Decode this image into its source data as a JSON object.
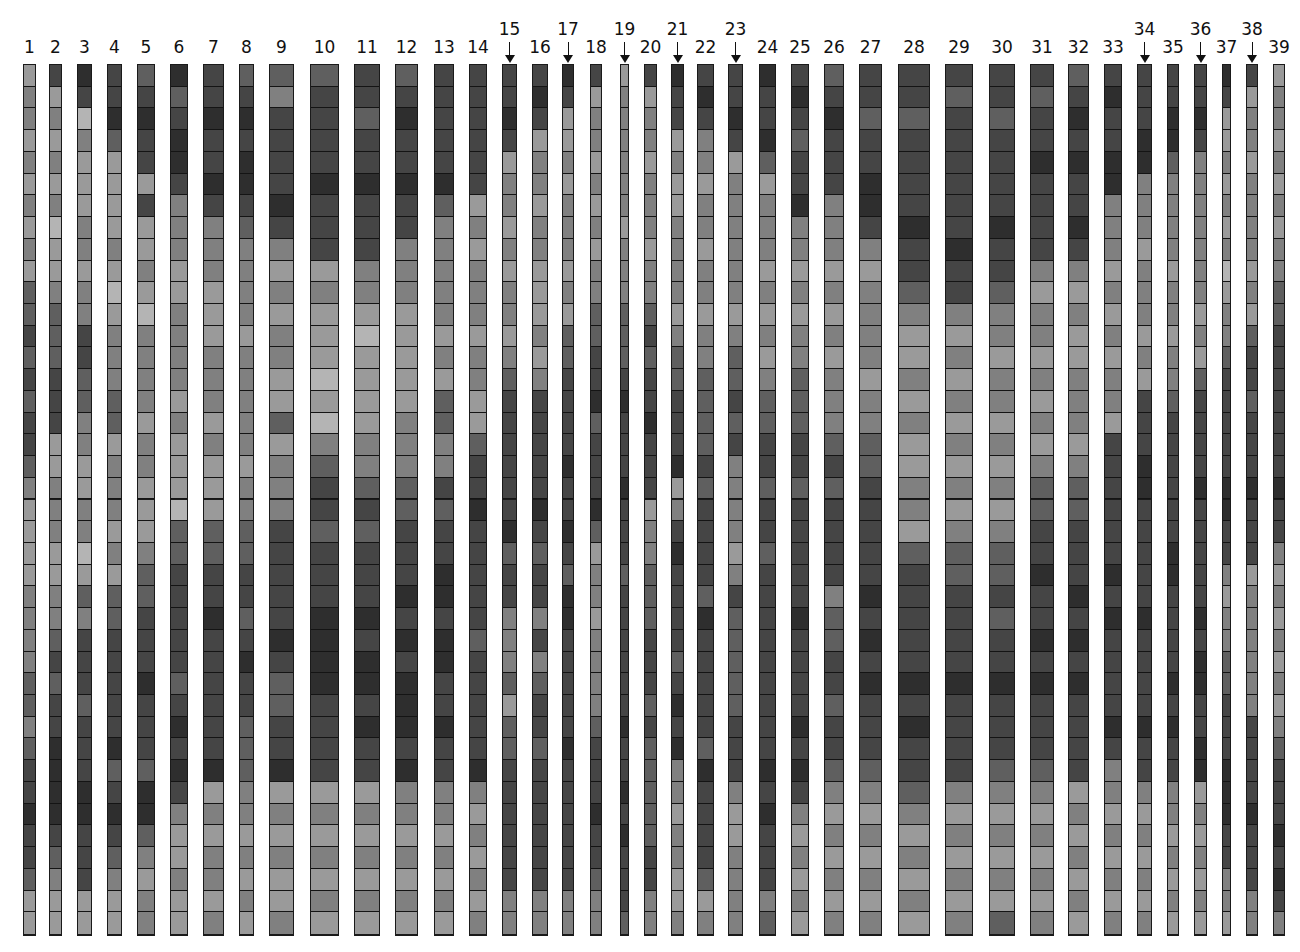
{
  "figure": {
    "rows_per_column": 40,
    "top": 64,
    "bottom": 936,
    "shade_scale": [
      "#b4b4b4",
      "#9a9a9a",
      "#808080",
      "#5f5f5f",
      "#454545",
      "#2e2e2e"
    ],
    "columns": [
      {
        "label": "1",
        "x0": 23,
        "x1": 36,
        "arrow": false,
        "shades": "1221212121334343443211112222332344544311"
      },
      {
        "label": "2",
        "x0": 49,
        "x1": 62,
        "arrow": false,
        "shades": "4121212011233344411222112234344555543211"
      },
      {
        "label": "3",
        "x0": 77,
        "x1": 92,
        "arrow": false,
        "shades": "5402111221224433221122013244434445544411"
      },
      {
        "label": "4",
        "x0": 107,
        "x1": 122,
        "arrow": false,
        "shades": "4453111121012223312221213344444534543211"
      },
      {
        "label": "5",
        "x0": 137,
        "x1": 155,
        "arrow": false,
        "shades": "3454414112102222122111233444544435532122"
      },
      {
        "label": "6",
        "x0": 170,
        "x1": 188,
        "arrow": false,
        "shades": "5345542221122221211103344444345454211211"
      },
      {
        "label": "7",
        "x0": 203,
        "x1": 224,
        "arrow": false,
        "shades": "4454454222111222121113344544444451212212"
      },
      {
        "label": "8",
        "x0": 239,
        "x1": 254,
        "arrow": false,
        "shades": "3454554322221222221223344345443332212121"
      },
      {
        "label": "9",
        "x0": 269,
        "x1": 294,
        "arrow": false,
        "shades": "3244445421212211312224444454334451212112"
      },
      {
        "label": "10",
        "x0": 310,
        "x1": 339,
        "arrow": false,
        "shades": "3444454441211101023443444555544441212121"
      },
      {
        "label": "11",
        "x0": 354,
        "x1": 380,
        "arrow": false,
        "shades": "4434454442210111122343444545545441212121"
      },
      {
        "label": "12",
        "x0": 395,
        "x1": 418,
        "arrow": false,
        "shades": "3454454422211111222334445454555452212121"
      },
      {
        "label": "13",
        "x0": 434,
        "x1": 454,
        "arrow": false,
        "shades": "4444453222221213322434455455445442212121"
      },
      {
        "label": "14",
        "x0": 469,
        "x1": 487,
        "arrow": false,
        "shades": "4444441212221221134454444434444452121212"
      },
      {
        "label": "15",
        "x0": 502,
        "x1": 517,
        "arrow": true,
        "shades": "4454122121221234444445344222313344444422"
      },
      {
        "label": "16",
        "x0": 532,
        "x1": 548,
        "arrow": false,
        "shades": "4541221221112124444454344242344344444422"
      },
      {
        "label": "17",
        "x0": 562,
        "x1": 574,
        "arrow": true,
        "shades": "5411212221213344445445435544444544444422"
      },
      {
        "label": "18",
        "x0": 590,
        "x1": 602,
        "arrow": false,
        "shades": "4122121212233445344453122122223444544322"
      },
      {
        "label": "19",
        "x0": 620,
        "x1": 629,
        "arrow": true,
        "shades": "1222222122233345444544434444445445454443"
      },
      {
        "label": "20",
        "x0": 644,
        "x1": 657,
        "arrow": false,
        "shades": "4122122212234344544412233344434333334422"
      },
      {
        "label": "21",
        "x0": 671,
        "x1": 684,
        "arrow": true,
        "shades": "5441211222212334445124544443454522122112"
      },
      {
        "label": "22",
        "x0": 697,
        "x1": 714,
        "arrow": false,
        "shades": "4542212212212233334344443544444354444312"
      },
      {
        "label": "23",
        "x0": 728,
        "x1": 743,
        "arrow": true,
        "shades": "4454122222212334342222124333334442112222"
      },
      {
        "label": "24",
        "x0": 759,
        "x1": 776,
        "arrow": false,
        "shades": "5445312221212123344344344444444454544423"
      },
      {
        "label": "25",
        "x0": 791,
        "x1": 809,
        "arrow": false,
        "shades": "4543445221212233344344444544445454212121"
      },
      {
        "label": "26",
        "x0": 824,
        "x1": 844,
        "arrow": false,
        "shades": "3454442221212122234344442334434432121212"
      },
      {
        "label": "27",
        "x0": 859,
        "x1": 882,
        "arrow": false,
        "shades": "4434455421222212233444445454544432121212"
      },
      {
        "label": "28",
        "x0": 898,
        "x1": 930,
        "arrow": false,
        "shades": "4434444544321121211221344444545443212121"
      },
      {
        "label": "29",
        "x0": 945,
        "x1": 973,
        "arrow": false,
        "shades": "4344444454421212121212334444544442121212"
      },
      {
        "label": "30",
        "x0": 989,
        "x1": 1015,
        "arrow": false,
        "shades": "4434444544322122121212334344544432121213"
      },
      {
        "label": "31",
        "x0": 1030,
        "x1": 1054,
        "arrow": false,
        "shades": "4344544442122121212334454454544432121212"
      },
      {
        "label": "32",
        "x0": 1068,
        "x1": 1089,
        "arrow": false,
        "shades": "3454544542121122212334445454544441212121"
      },
      {
        "label": "33",
        "x0": 1104,
        "x1": 1122,
        "arrow": false,
        "shades": "4544552221212122144444454544445422121212"
      },
      {
        "label": "34",
        "x0": 1137,
        "x1": 1152,
        "arrow": true,
        "shades": "4445522212221214445544444544445442121212"
      },
      {
        "label": "35",
        "x0": 1167,
        "x1": 1179,
        "arrow": false,
        "shades": "4455322221221223444444554444545442212121"
      },
      {
        "label": "36",
        "x0": 1194,
        "x1": 1207,
        "arrow": true,
        "shades": "4454222222212134444544444545544551212121"
      },
      {
        "label": "37",
        "x0": 1222,
        "x1": 1231,
        "arrow": false,
        "shades": "5411212120122344444554421223344455544221"
      },
      {
        "label": "38",
        "x0": 1246,
        "x1": 1258,
        "arrow": true,
        "shades": "4122122221213443444544412222224444544422"
      },
      {
        "label": "39",
        "x0": 1273,
        "x1": 1285,
        "arrow": false,
        "shades": "1221212122334444444544212121212344454542"
      }
    ]
  }
}
